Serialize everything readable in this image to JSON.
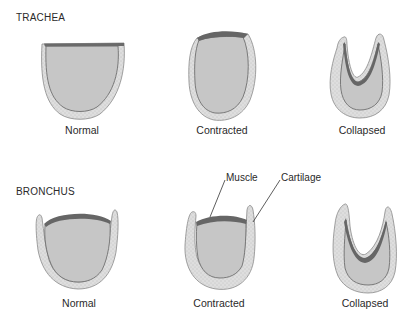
{
  "figure": {
    "sections": [
      {
        "title": "TRACHEA",
        "panels": [
          {
            "caption": "Normal"
          },
          {
            "caption": "Contracted"
          },
          {
            "caption": "Collapsed"
          }
        ]
      },
      {
        "title": "BRONCHUS",
        "panels": [
          {
            "caption": "Normal"
          },
          {
            "caption": "Contracted"
          },
          {
            "caption": "Collapsed"
          }
        ]
      }
    ],
    "annotations": {
      "muscle": "Muscle",
      "cartilage": "Cartilage"
    },
    "colors": {
      "lumen": "#c8c8c8",
      "cartilage": "#dcdcdc",
      "muscle": "#6e6e6e",
      "outline": "#7a7a7a"
    }
  }
}
